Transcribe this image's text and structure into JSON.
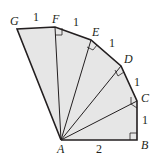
{
  "diagram": {
    "fill_color": "#e6e6e6",
    "stroke_color": "#231f20",
    "vertices": {
      "A": {
        "label": "A",
        "x": 61,
        "y": 140
      },
      "B": {
        "label": "B",
        "x": 137,
        "y": 140
      },
      "C": {
        "label": "C",
        "x": 137,
        "y": 101
      },
      "D": {
        "label": "D",
        "x": 121,
        "y": 66
      },
      "E": {
        "label": "E",
        "x": 91,
        "y": 40
      },
      "F": {
        "label": "F",
        "x": 55,
        "y": 27
      },
      "G": {
        "label": "G",
        "x": 17,
        "y": 29
      }
    },
    "segment_labels": {
      "AB": "2",
      "BC": "1",
      "CD": "1",
      "DE": "1",
      "EF": "1",
      "FG": "1"
    },
    "right_angles": [
      "B",
      "C",
      "D",
      "E",
      "F"
    ]
  }
}
